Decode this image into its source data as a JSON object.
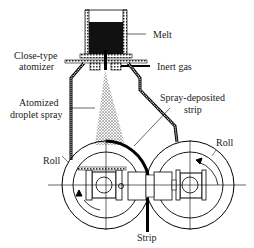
{
  "diagram": {
    "type": "spray-deposition twin-roll apparatus",
    "labels": {
      "melt": "Melt",
      "atomizer_line1": "Close-type",
      "atomizer_line2": "atomizer",
      "inert_gas": "Inert gas",
      "spray_line1": "Atomized",
      "spray_line2": "droplet spray",
      "strip_dep_line1": "Spray-deposited",
      "strip_dep_line2": "strip",
      "roll_left": "Roll",
      "roll_right": "Roll",
      "strip": "Strip"
    }
  }
}
